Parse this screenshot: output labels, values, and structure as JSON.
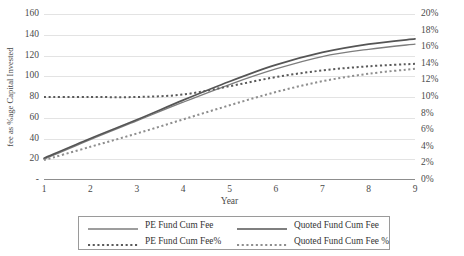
{
  "chart_data": {
    "type": "line",
    "title": "",
    "xlabel": "Year",
    "ylabel": "fee as %age Capital Invested",
    "y2label": "",
    "x": [
      1,
      2,
      3,
      4,
      5,
      6,
      7,
      8,
      9
    ],
    "xtick_labels": [
      "1",
      "2",
      "3",
      "4",
      "5",
      "6",
      "7",
      "8",
      "9"
    ],
    "xlim": [
      1,
      9
    ],
    "ylim": [
      0,
      160
    ],
    "ytick_labels": [
      "-",
      "20",
      "40",
      "60",
      "80",
      "100",
      "120",
      "140",
      "160"
    ],
    "ytick_values": [
      0,
      20,
      40,
      60,
      80,
      100,
      120,
      140,
      160
    ],
    "y2lim": [
      0,
      20
    ],
    "y2tick_labels": [
      "0%",
      "2%",
      "4%",
      "6%",
      "8%",
      "10%",
      "12%",
      "14%",
      "16%",
      "18%",
      "20%"
    ],
    "y2tick_values": [
      0,
      2,
      4,
      6,
      8,
      10,
      12,
      14,
      16,
      18,
      20
    ],
    "grid": true,
    "legend_position": "bottom",
    "series": [
      {
        "name": "PE Fund Cum Fee",
        "axis": "left",
        "style": "solid",
        "color": "#7d7d7d",
        "width": 1.3,
        "values": [
          20,
          39,
          57,
          75,
          92,
          107,
          119,
          126,
          131
        ]
      },
      {
        "name": "Quoted Fund Cum Fee",
        "axis": "left",
        "style": "solid",
        "color": "#555555",
        "width": 1.7,
        "values": [
          21,
          40,
          58,
          77,
          95,
          111,
          123,
          131,
          136
        ]
      },
      {
        "name": "PE Fund Cum Fee%",
        "axis": "right",
        "style": "dotted",
        "color": "#5a5a5a",
        "width": 2.0,
        "values": [
          10.0,
          10.0,
          10.0,
          10.3,
          11.3,
          12.4,
          13.2,
          13.7,
          14.0
        ]
      },
      {
        "name": "Quoted Fund Cum Fee %",
        "axis": "right",
        "style": "dotted",
        "color": "#8e8e8e",
        "width": 2.0,
        "values": [
          2.4,
          4.0,
          5.6,
          7.3,
          9.0,
          10.6,
          11.9,
          12.8,
          13.4
        ]
      }
    ]
  },
  "legend": {
    "items": [
      {
        "label": "PE Fund Cum Fee",
        "style": "solid",
        "color": "#7d7d7d"
      },
      {
        "label": "Quoted Fund Cum Fee",
        "style": "solid",
        "color": "#555555"
      },
      {
        "label": "PE Fund Cum Fee%",
        "style": "dotted",
        "color": "#5a5a5a"
      },
      {
        "label": "Quoted Fund Cum Fee %",
        "style": "dotted",
        "color": "#8e8e8e"
      }
    ]
  }
}
